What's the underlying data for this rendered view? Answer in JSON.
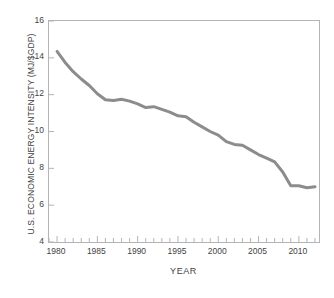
{
  "chart_data": {
    "type": "line",
    "title": "",
    "subtitle": "",
    "xlabel": "YEAR",
    "ylabel": "U.S. ECONOMIC ENERGY INTENSITY (MJ/$GDP)",
    "xlim": [
      1979,
      2012.5
    ],
    "ylim": [
      4,
      16
    ],
    "x_major_ticks": [
      1980,
      1985,
      1990,
      1995,
      2000,
      2005,
      2010
    ],
    "x_minor_tick_step": 1,
    "y_major_ticks": [
      4,
      6,
      8,
      10,
      12,
      14,
      16
    ],
    "x_tick_labels": [
      "1980",
      "1985",
      "1990",
      "1995",
      "2000",
      "2005",
      "2010"
    ],
    "y_tick_labels": [
      "4",
      "6",
      "8",
      "10",
      "12",
      "14",
      "16"
    ],
    "grid": false,
    "legend": null,
    "legend_position": "none",
    "line_color": "#8c8c8c",
    "line_width": 3.0,
    "series": [
      {
        "name": "U.S. economic energy intensity",
        "color": "#8c8c8c",
        "x": [
          1980,
          1981,
          1982,
          1983,
          1984,
          1985,
          1986,
          1987,
          1988,
          1989,
          1990,
          1991,
          1992,
          1993,
          1994,
          1995,
          1996,
          1997,
          1998,
          1999,
          2000,
          2001,
          2002,
          2003,
          2004,
          2005,
          2006,
          2007,
          2008,
          2009,
          2010,
          2011,
          2012
        ],
        "values": [
          14.35,
          13.75,
          13.25,
          12.85,
          12.5,
          12.05,
          11.72,
          11.68,
          11.75,
          11.65,
          11.5,
          11.3,
          11.35,
          11.2,
          11.05,
          10.85,
          10.8,
          10.5,
          10.25,
          10.0,
          9.8,
          9.45,
          9.3,
          9.25,
          9.0,
          8.75,
          8.55,
          8.35,
          7.8,
          7.05,
          7.05,
          6.95,
          7.0
        ]
      }
    ],
    "annotations": []
  },
  "figure": {
    "background_color": "#ffffff",
    "axis_color": "#b4b4b4",
    "text_color": "#3f3f3f"
  }
}
